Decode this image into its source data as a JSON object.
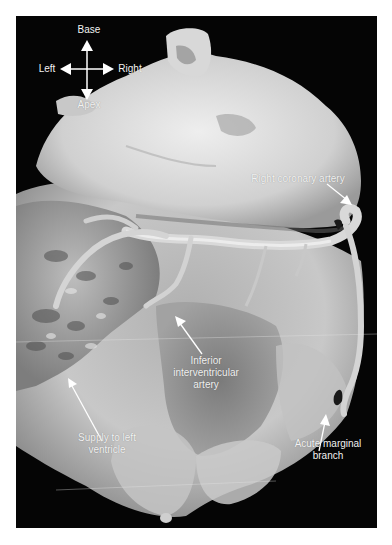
{
  "figure": {
    "background_color": "#050505",
    "label_color": "#f2f2f2"
  },
  "orientation": {
    "top": "Base",
    "left": "Left",
    "right": "Right",
    "bottom": "Apex"
  },
  "labels": [
    {
      "id": "right-coronary-artery",
      "lines": [
        "Right coronary artery"
      ]
    },
    {
      "id": "inferior-interventricular-artery",
      "lines": [
        "Inferior",
        "interventricular",
        "artery"
      ]
    },
    {
      "id": "supply-to-left-ventricle",
      "lines": [
        "Supply to left",
        "ventricle"
      ]
    },
    {
      "id": "acute-marginal-branch",
      "lines": [
        "Acute marginal",
        "branch"
      ]
    }
  ]
}
